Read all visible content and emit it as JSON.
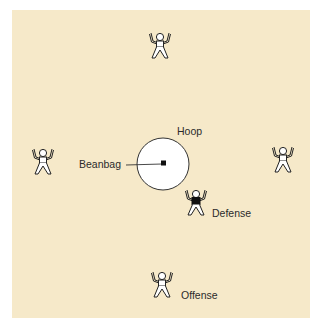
{
  "diagram": {
    "background_color": "#f6e9c9",
    "labels": {
      "hoop": "Hoop",
      "beanbag": "Beanbag",
      "defense": "Defense",
      "offense": "Offense"
    },
    "players": [
      {
        "role": "offense",
        "position": "top",
        "shirt": "white"
      },
      {
        "role": "offense",
        "position": "left",
        "shirt": "white"
      },
      {
        "role": "offense",
        "position": "right",
        "shirt": "white"
      },
      {
        "role": "offense",
        "position": "bottom",
        "shirt": "white"
      },
      {
        "role": "defense",
        "position": "near-hoop",
        "shirt": "black"
      }
    ],
    "hoop": {
      "shape": "circle",
      "fill": "#ffffff"
    },
    "beanbag": {
      "shape": "square",
      "fill": "#111111"
    }
  }
}
